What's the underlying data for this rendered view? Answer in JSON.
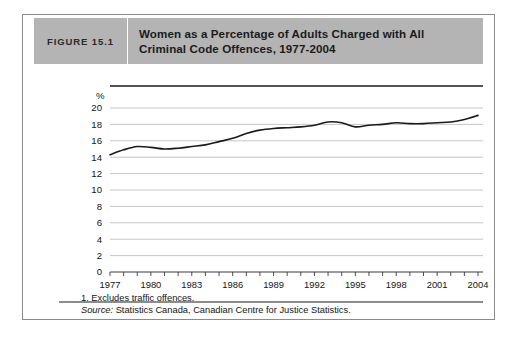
{
  "figure": {
    "label": "FIGURE 15.1",
    "title_line1": "Women as a Percentage of Adults Charged with All",
    "title_line2": "Criminal Code Offences, 1977-2004",
    "header_bg": "#b4b4b4",
    "frame_border": "#8b8b8b"
  },
  "footnotes": {
    "note": "1. Excludes traffic offences.",
    "source_label": "Source:",
    "source_text": " Statistics Canada, Canadian Centre for Justice Statistics."
  },
  "chart_data": {
    "type": "line",
    "title": "Women as a Percentage of Adults Charged with All Criminal Code Offences, 1977-2004",
    "xlabel": "",
    "ylabel": "%",
    "ylim": [
      0,
      20
    ],
    "xlim": [
      1977,
      2004
    ],
    "ytick_step": 2,
    "yticks": [
      0,
      2,
      4,
      6,
      8,
      10,
      12,
      14,
      16,
      18,
      20
    ],
    "ytick_labels": [
      "0",
      "2",
      "4",
      "6",
      "8",
      "10",
      "12",
      "14",
      "16",
      "18",
      "20"
    ],
    "xticks": [
      1977,
      1978,
      1979,
      1980,
      1981,
      1982,
      1983,
      1984,
      1985,
      1986,
      1987,
      1988,
      1989,
      1990,
      1991,
      1992,
      1993,
      1994,
      1995,
      1996,
      1997,
      1998,
      1999,
      2000,
      2001,
      2002,
      2003,
      2004
    ],
    "xtick_labels_shown": [
      "1977",
      "1980",
      "1983",
      "1986",
      "1989",
      "1992",
      "1995",
      "1998",
      "2001",
      "2004"
    ],
    "xtick_label_interval": 3,
    "grid": true,
    "grid_axis": "y",
    "grid_color": "#c0c0c0",
    "legend": null,
    "line_color": "#1a1a1a",
    "line_width": 1.6,
    "series": [
      {
        "name": "Women as a percentage of adults charged",
        "x": [
          1977,
          1978,
          1979,
          1980,
          1981,
          1982,
          1983,
          1984,
          1985,
          1986,
          1987,
          1988,
          1989,
          1990,
          1991,
          1992,
          1993,
          1994,
          1995,
          1996,
          1997,
          1998,
          1999,
          2000,
          2001,
          2002,
          2003,
          2004
        ],
        "values": [
          14.3,
          14.9,
          15.3,
          15.2,
          15.0,
          15.1,
          15.3,
          15.5,
          15.9,
          16.3,
          16.9,
          17.3,
          17.5,
          17.6,
          17.7,
          17.9,
          18.3,
          18.2,
          17.7,
          17.9,
          18.0,
          18.2,
          18.1,
          18.1,
          18.2,
          18.3,
          18.6,
          19.1
        ]
      }
    ]
  }
}
